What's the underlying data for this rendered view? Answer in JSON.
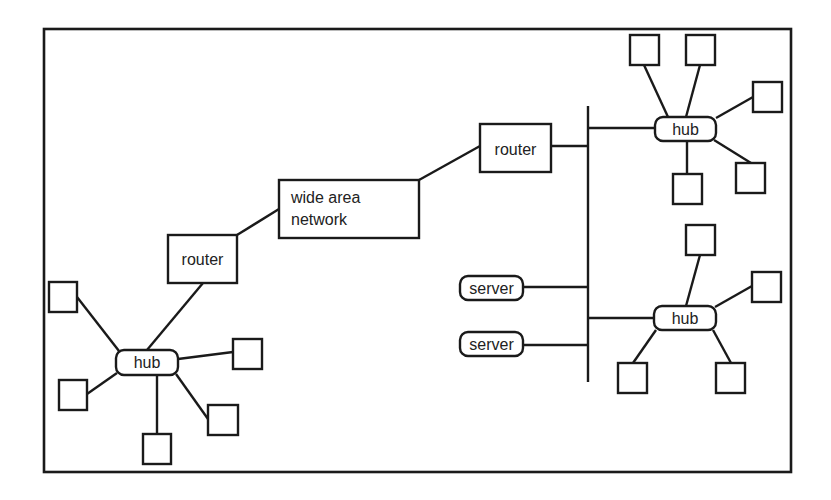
{
  "diagram": {
    "title": "",
    "type": "network-topology",
    "colors": {
      "stroke": "#1a1a1a",
      "text": "#222222",
      "background": "#ffffff"
    },
    "frame": {
      "x": 44,
      "y": 29,
      "w": 747,
      "h": 443
    },
    "labels": {
      "wan": [
        "wide area",
        "network"
      ],
      "router_left": "router",
      "router_right": "router",
      "hub_left": "hub",
      "hub_top_right": "hub",
      "hub_bottom_right": "hub",
      "server_1": "server",
      "server_2": "server"
    },
    "nodes": [
      {
        "id": "wan",
        "kind": "network",
        "label": "wide area network",
        "x": 279,
        "y": 180,
        "w": 140,
        "h": 58
      },
      {
        "id": "router_left",
        "kind": "router",
        "label": "router",
        "x": 168,
        "y": 235,
        "w": 69,
        "h": 48
      },
      {
        "id": "router_right",
        "kind": "router",
        "label": "router",
        "x": 480,
        "y": 124,
        "w": 71,
        "h": 48
      },
      {
        "id": "hub_left",
        "kind": "hub",
        "label": "hub",
        "x": 116,
        "y": 350,
        "w": 62,
        "h": 25
      },
      {
        "id": "hub_top_right",
        "kind": "hub",
        "label": "hub",
        "x": 655,
        "y": 117,
        "w": 61,
        "h": 24
      },
      {
        "id": "hub_bottom_right",
        "kind": "hub",
        "label": "hub",
        "x": 654,
        "y": 306,
        "w": 62,
        "h": 24
      },
      {
        "id": "server_1",
        "kind": "server",
        "label": "server",
        "x": 460,
        "y": 276,
        "w": 63,
        "h": 24
      },
      {
        "id": "server_2",
        "kind": "server",
        "label": "server",
        "x": 460,
        "y": 332,
        "w": 63,
        "h": 24
      }
    ],
    "bus": {
      "x": 588,
      "y1": 106,
      "y2": 382
    },
    "hosts": {
      "left": [
        {
          "x": 49,
          "y": 282
        },
        {
          "x": 59,
          "y": 380
        },
        {
          "x": 143,
          "y": 434
        },
        {
          "x": 208,
          "y": 405
        },
        {
          "x": 233,
          "y": 339
        }
      ],
      "top_right": [
        {
          "x": 630,
          "y": 35
        },
        {
          "x": 686,
          "y": 35
        },
        {
          "x": 753,
          "y": 82
        },
        {
          "x": 736,
          "y": 163
        },
        {
          "x": 673,
          "y": 174
        }
      ],
      "bottom_right": [
        {
          "x": 686,
          "y": 225
        },
        {
          "x": 752,
          "y": 272
        },
        {
          "x": 618,
          "y": 363
        },
        {
          "x": 716,
          "y": 363
        }
      ]
    },
    "edges": [
      [
        "router_left",
        "wan"
      ],
      [
        "wan",
        "router_right"
      ],
      [
        "router_left",
        "hub_left"
      ],
      [
        "router_right",
        "bus"
      ],
      [
        "bus",
        "hub_top_right"
      ],
      [
        "bus",
        "hub_bottom_right"
      ],
      [
        "server_1",
        "bus"
      ],
      [
        "server_2",
        "bus"
      ]
    ]
  }
}
